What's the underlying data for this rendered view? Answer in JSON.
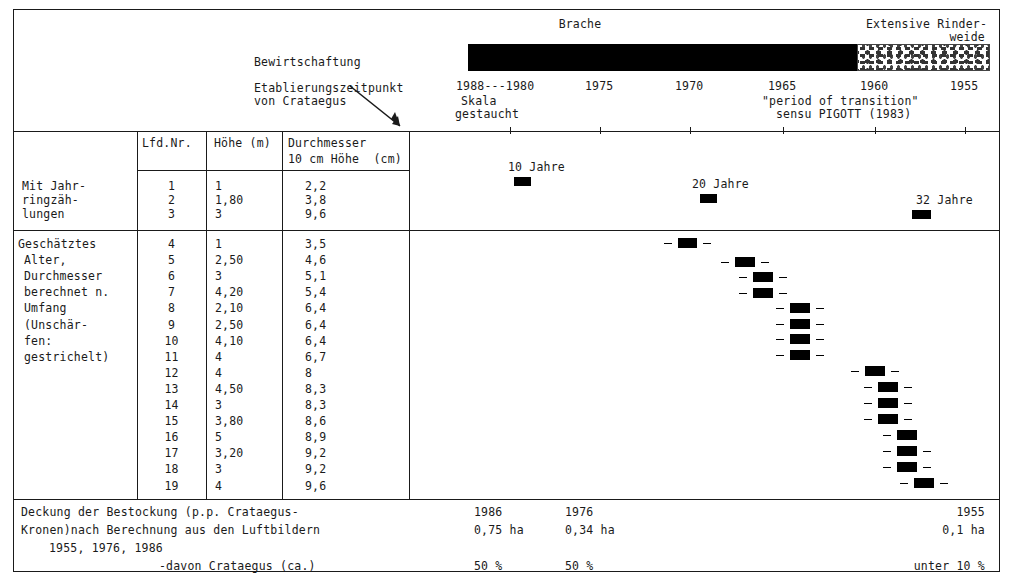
{
  "figure": {
    "domain": "chart",
    "accent_color": "#000000",
    "frame_color": "#1a1a1a"
  },
  "header": {
    "management_label": "Bewirtschaftung",
    "establishment_label_line1": "Etablierungszeitpunkt",
    "establishment_label_line2": "von Crataegus",
    "band_labels": {
      "fallow": "Brache",
      "pasture_line1": "Extensive Rinder-",
      "pasture_line2": "weide"
    },
    "scale_note_line1": "Skala",
    "scale_note_line2": "gestaucht",
    "transition_note_line1": "\"period of transition\"",
    "transition_note_line2": "sensu PIGOTT (1983)"
  },
  "axis": {
    "label_first": "1988---1980",
    "ticks": [
      "1975",
      "1970",
      "1965",
      "1960",
      "1955"
    ],
    "all_labels": [
      "1988---1980",
      "1975",
      "1970",
      "1965",
      "1960",
      "1955"
    ]
  },
  "table": {
    "columns": {
      "group": "",
      "nr": "Lfd.Nr.",
      "height": "Höhe (m)",
      "diameter_line1": "Durchmesser",
      "diameter_line2": "10 cm Höhe  (cm)"
    },
    "group1": {
      "label_lines": [
        "Mit Jahr-",
        "ringzäh-",
        "lungen"
      ],
      "rows": [
        {
          "nr": "1",
          "height": "1",
          "diameter": "2,2"
        },
        {
          "nr": "2",
          "height": "1,80",
          "diameter": "3,8"
        },
        {
          "nr": "3",
          "height": "3",
          "diameter": "9,6"
        }
      ]
    },
    "group2": {
      "label_lines": [
        "Geschätztes",
        "Alter,",
        "Durchmesser",
        "berechnet n.",
        "Umfang",
        "(Unschär-",
        "fen:",
        "gestrichelt)"
      ],
      "rows": [
        {
          "nr": "4",
          "height": "1",
          "diameter": "3,5"
        },
        {
          "nr": "5",
          "height": "2,50",
          "diameter": "4,6"
        },
        {
          "nr": "6",
          "height": "3",
          "diameter": "5,1"
        },
        {
          "nr": "7",
          "height": "4,20",
          "diameter": "5,4"
        },
        {
          "nr": "8",
          "height": "2,10",
          "diameter": "6,4"
        },
        {
          "nr": "9",
          "height": "2,50",
          "diameter": "6,4"
        },
        {
          "nr": "10",
          "height": "4,10",
          "diameter": "6,4"
        },
        {
          "nr": "11",
          "height": "4",
          "diameter": "6,7"
        },
        {
          "nr": "12",
          "height": "4",
          "diameter": "8"
        },
        {
          "nr": "13",
          "height": "4,50",
          "diameter": "8,3"
        },
        {
          "nr": "14",
          "height": "3",
          "diameter": "8,3"
        },
        {
          "nr": "15",
          "height": "3,80",
          "diameter": "8,6"
        },
        {
          "nr": "16",
          "height": "5",
          "diameter": "8,9"
        },
        {
          "nr": "17",
          "height": "3,20",
          "diameter": "9,2"
        },
        {
          "nr": "18",
          "height": "3",
          "diameter": "9,2"
        },
        {
          "nr": "19",
          "height": "4",
          "diameter": "9,6"
        }
      ]
    }
  },
  "footer": {
    "text_line1": "Deckung der Bestockung (p.p. Crataegus-",
    "text_line2": "Kronen)nach Berechnung aus den Luftbildern",
    "text_line3": "1955, 1976, 1986",
    "text_line4": "-davon Crataegus (ca.)",
    "years": [
      "1986",
      "1976",
      "1955"
    ],
    "areas": [
      "0,75 ha",
      "0,34 ha",
      "0,1 ha"
    ],
    "percents": [
      "50 %",
      "50 %",
      "unter 10 %"
    ]
  },
  "chart_data": {
    "type": "scatter",
    "title": "Etablierungszeitpunkt von Crataegus",
    "xlabel": "Jahr",
    "ylabel": "Lfd.Nr.",
    "x_axis_inverted": true,
    "xlim": [
      1988,
      1953
    ],
    "grid": false,
    "legend": null,
    "annotations": [
      "10 Jahre",
      "20 Jahre",
      "32 Jahre",
      "Brache",
      "Extensive Rinderweide",
      "\"period of transition\" sensu PIGOTT (1983)"
    ],
    "bands": [
      {
        "label": "Brache",
        "from": 1988,
        "to": 1960,
        "fill": "solid-black"
      },
      {
        "label": "Extensive Rinderweide",
        "from": 1960,
        "to": 1954,
        "fill": "stippled"
      }
    ],
    "series": [
      {
        "name": "Mit Jahrringzählungen",
        "points": [
          {
            "nr": "1",
            "age_label": "10 Jahre",
            "year": 1978,
            "uncertainty": false
          },
          {
            "nr": "2",
            "age_label": "20 Jahre",
            "year": 1968,
            "uncertainty": false
          },
          {
            "nr": "3",
            "age_label": "32 Jahre",
            "year": 1956,
            "uncertainty": false
          }
        ]
      },
      {
        "name": "Geschätztes Alter (Unschärfen gestrichelt)",
        "points": [
          {
            "nr": "4",
            "year": 1969.5,
            "uncertainty": true
          },
          {
            "nr": "5",
            "year": 1967.0,
            "uncertainty": true
          },
          {
            "nr": "6",
            "year": 1966.3,
            "uncertainty": true
          },
          {
            "nr": "7",
            "year": 1966.3,
            "uncertainty": true
          },
          {
            "nr": "8",
            "year": 1964.0,
            "uncertainty": true
          },
          {
            "nr": "9",
            "year": 1964.0,
            "uncertainty": true
          },
          {
            "nr": "10",
            "year": 1964.0,
            "uncertainty": true
          },
          {
            "nr": "11",
            "year": 1964.0,
            "uncertainty": true
          },
          {
            "nr": "12",
            "year": 1961.0,
            "uncertainty": true
          },
          {
            "nr": "13",
            "year": 1960.4,
            "uncertainty": true
          },
          {
            "nr": "14",
            "year": 1960.4,
            "uncertainty": true
          },
          {
            "nr": "15",
            "year": 1960.4,
            "uncertainty": true
          },
          {
            "nr": "16",
            "year": 1959.5,
            "uncertainty": true
          },
          {
            "nr": "17",
            "year": 1959.5,
            "uncertainty": true
          },
          {
            "nr": "18",
            "year": 1959.5,
            "uncertainty": true
          },
          {
            "nr": "19",
            "year": 1958.6,
            "uncertainty": true
          }
        ]
      }
    ]
  },
  "marks": {
    "top": [
      {
        "label": "10 Jahre",
        "label_x": 508,
        "label_y": 161,
        "bar_x": 514,
        "bar_y": 177,
        "bar_w": 17
      },
      {
        "label": "20 Jahre",
        "label_x": 692,
        "label_y": 178,
        "bar_x": 700,
        "bar_y": 194,
        "bar_w": 17
      },
      {
        "label": "32 Jahre",
        "label_x": 916,
        "label_y": 194,
        "bar_x": 912,
        "bar_y": 210,
        "bar_w": 19
      }
    ],
    "rows": [
      {
        "nr": "4",
        "bar_x": 678,
        "bar_y": 238,
        "bar_w": 19,
        "dl": true,
        "dr": true
      },
      {
        "nr": "5",
        "bar_x": 735,
        "bar_y": 257,
        "bar_w": 20,
        "dl": true,
        "dr": true
      },
      {
        "nr": "6",
        "bar_x": 753,
        "bar_y": 272,
        "bar_w": 20,
        "dl": true,
        "dr": true
      },
      {
        "nr": "7",
        "bar_x": 753,
        "bar_y": 288,
        "bar_w": 20,
        "dl": true,
        "dr": true
      },
      {
        "nr": "8",
        "bar_x": 790,
        "bar_y": 303,
        "bar_w": 20,
        "dl": true,
        "dr": true
      },
      {
        "nr": "9",
        "bar_x": 790,
        "bar_y": 319,
        "bar_w": 20,
        "dl": true,
        "dr": true
      },
      {
        "nr": "10",
        "bar_x": 790,
        "bar_y": 334,
        "bar_w": 20,
        "dl": true,
        "dr": true
      },
      {
        "nr": "11",
        "bar_x": 790,
        "bar_y": 350,
        "bar_w": 20,
        "dl": true,
        "dr": true
      },
      {
        "nr": "12",
        "bar_x": 865,
        "bar_y": 366,
        "bar_w": 20,
        "dl": true,
        "dr": true
      },
      {
        "nr": "13",
        "bar_x": 878,
        "bar_y": 382,
        "bar_w": 20,
        "dl": true,
        "dr": true
      },
      {
        "nr": "14",
        "bar_x": 878,
        "bar_y": 398,
        "bar_w": 20,
        "dl": true,
        "dr": true
      },
      {
        "nr": "15",
        "bar_x": 878,
        "bar_y": 414,
        "bar_w": 20,
        "dl": true,
        "dr": true
      },
      {
        "nr": "16",
        "bar_x": 897,
        "bar_y": 430,
        "bar_w": 20,
        "dl": true,
        "dr": false
      },
      {
        "nr": "17",
        "bar_x": 897,
        "bar_y": 446,
        "bar_w": 20,
        "dl": true,
        "dr": true
      },
      {
        "nr": "18",
        "bar_x": 897,
        "bar_y": 462,
        "bar_w": 20,
        "dl": true,
        "dr": true
      },
      {
        "nr": "19",
        "bar_x": 914,
        "bar_y": 478,
        "bar_w": 20,
        "dl": true,
        "dr": true
      }
    ]
  }
}
